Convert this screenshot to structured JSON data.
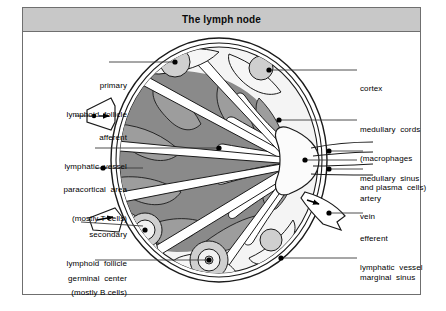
{
  "figure": {
    "title": "The lymph node",
    "title_bar_color": "#c8c8c8",
    "border_color": "#6f6f6f",
    "background_color": "#ffffff"
  },
  "palette": {
    "capsule_line": "#1a1a1a",
    "sinus_white": "#ffffff",
    "cortex_light": "#f2f2f2",
    "follicle_grey": "#c9c9c9",
    "paracortex_dark": "#8a8a8a",
    "medullary_cord_grey": "#9d9d9d",
    "hilum_white": "#fbfbfb",
    "leader_line": "#3a3a3a",
    "dot": "#000000"
  },
  "labels": {
    "left": [
      {
        "id": "primary-lymphoid-follicle",
        "lines": [
          "primary",
          "lymphoid  follicle"
        ]
      },
      {
        "id": "afferent-lymphatic-vessel",
        "lines": [
          "afferent",
          "lymphatic  vessel"
        ]
      },
      {
        "id": "paracortical-area",
        "lines": [
          "paracortical  area",
          "(mostly T cells)"
        ]
      },
      {
        "id": "secondary-lymphoid-follicle",
        "lines": [
          "secondary",
          "lymphoid  follicle",
          "(mostly B cells)"
        ]
      },
      {
        "id": "germinal-center",
        "lines": [
          "germinal  center"
        ]
      }
    ],
    "right": [
      {
        "id": "cortex",
        "lines": [
          "cortex"
        ]
      },
      {
        "id": "medullary-cords",
        "lines": [
          "medullary  cords",
          "(macrophages",
          "and plasma  cells)"
        ]
      },
      {
        "id": "medullary-sinus",
        "lines": [
          "medullary  sinus"
        ]
      },
      {
        "id": "artery",
        "lines": [
          "artery"
        ]
      },
      {
        "id": "vein",
        "lines": [
          "vein"
        ]
      },
      {
        "id": "efferent-lymphatic-vessel",
        "lines": [
          "efferent",
          "lymphatic  vessel"
        ]
      },
      {
        "id": "marginal-sinus",
        "lines": [
          "marginal  sinus"
        ]
      }
    ]
  },
  "anatomy": {
    "structures": [
      "capsule",
      "marginal sinus",
      "cortex",
      "primary lymphoid follicles",
      "secondary lymphoid follicles with germinal centers",
      "paracortical area",
      "medullary cords",
      "medullary sinuses",
      "hilum",
      "artery",
      "vein",
      "afferent lymphatic vessel",
      "efferent lymphatic vessel"
    ],
    "flow": {
      "afferent_direction": "into node",
      "efferent_direction": "out of node"
    }
  }
}
